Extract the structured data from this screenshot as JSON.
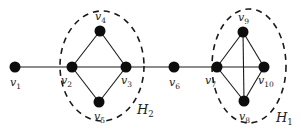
{
  "diagram": {
    "type": "graph",
    "nodes": [
      {
        "id": "v1",
        "base": "v",
        "sub": "1",
        "x": 15,
        "y": 67,
        "lx": 10,
        "ly": 86
      },
      {
        "id": "v2",
        "base": "v",
        "sub": "2",
        "x": 72,
        "y": 67,
        "lx": 61,
        "ly": 84
      },
      {
        "id": "v3",
        "base": "v",
        "sub": "3",
        "x": 126,
        "y": 67,
        "lx": 121,
        "ly": 84
      },
      {
        "id": "v4",
        "base": "v",
        "sub": "4",
        "x": 100,
        "y": 31,
        "lx": 95,
        "ly": 20
      },
      {
        "id": "v5",
        "base": "v",
        "sub": "5",
        "x": 99,
        "y": 102,
        "lx": 94,
        "ly": 120
      },
      {
        "id": "v6",
        "base": "v",
        "sub": "6",
        "x": 174,
        "y": 67,
        "lx": 169,
        "ly": 86
      },
      {
        "id": "v7",
        "base": "v",
        "sub": "7",
        "x": 217,
        "y": 67,
        "lx": 205,
        "ly": 84
      },
      {
        "id": "v8",
        "base": "v",
        "sub": "8",
        "x": 244,
        "y": 101,
        "lx": 239,
        "ly": 120
      },
      {
        "id": "v9",
        "base": "v",
        "sub": "9",
        "x": 243,
        "y": 32,
        "lx": 238,
        "ly": 21
      },
      {
        "id": "v10",
        "base": "v",
        "sub": "10",
        "x": 264,
        "y": 67,
        "lx": 258,
        "ly": 84
      }
    ],
    "edges": [
      [
        "v1",
        "v2"
      ],
      [
        "v2",
        "v3"
      ],
      [
        "v2",
        "v4"
      ],
      [
        "v4",
        "v3"
      ],
      [
        "v2",
        "v5"
      ],
      [
        "v5",
        "v3"
      ],
      [
        "v3",
        "v6"
      ],
      [
        "v6",
        "v7"
      ],
      [
        "v7",
        "v9"
      ],
      [
        "v7",
        "v10"
      ],
      [
        "v7",
        "v8"
      ],
      [
        "v9",
        "v10"
      ],
      [
        "v9",
        "v8"
      ],
      [
        "v8",
        "v10"
      ]
    ],
    "groups": [
      {
        "id": "H2",
        "base": "H",
        "sub": "2",
        "cx": 102,
        "cy": 66,
        "rx": 42,
        "ry": 55,
        "lx": 137,
        "ly": 114,
        "members": [
          "v2",
          "v3",
          "v4",
          "v5"
        ]
      },
      {
        "id": "H1",
        "base": "H",
        "sub": "1",
        "cx": 249,
        "cy": 66,
        "rx": 37,
        "ry": 57,
        "lx": 276,
        "ly": 122,
        "members": [
          "v7",
          "v8",
          "v9",
          "v10"
        ]
      }
    ]
  }
}
